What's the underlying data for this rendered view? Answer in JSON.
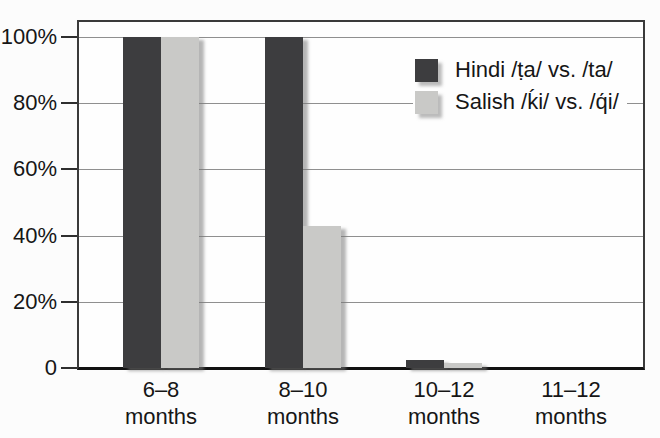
{
  "chart_data": {
    "type": "bar",
    "categories": [
      "6–8",
      "8–10",
      "10–12",
      "11–12"
    ],
    "category_unit": "months",
    "series": [
      {
        "name": "Hindi /ṭa/ vs. /ta/",
        "color": "#3d3d3f",
        "values": [
          100,
          100,
          2.5,
          0
        ]
      },
      {
        "name": "Salish /ḱi/ vs. /q́i/",
        "color": "#c9c9c7",
        "values": [
          100,
          43,
          1.5,
          0
        ]
      }
    ],
    "y_axis": {
      "ticks": [
        {
          "label": "100%",
          "value": 100
        },
        {
          "label": "80%",
          "value": 80
        },
        {
          "label": "60%",
          "value": 60
        },
        {
          "label": "40%",
          "value": 40
        },
        {
          "label": "20%",
          "value": 20
        },
        {
          "label": "0",
          "value": 0
        }
      ],
      "ylim": [
        0,
        100
      ]
    },
    "grid": {
      "horizontal_at": [
        20,
        40,
        60,
        80,
        100
      ]
    },
    "legend_position": "top-right-inside"
  },
  "colors": {
    "bar_dark": "#3d3d3f",
    "bar_light": "#c9c9c7",
    "gridline": "#8f8f8f",
    "frame_border": "#3a3a3a",
    "axis_bottom": "#121212",
    "text": "#161616",
    "background": "#fcfcfc"
  }
}
